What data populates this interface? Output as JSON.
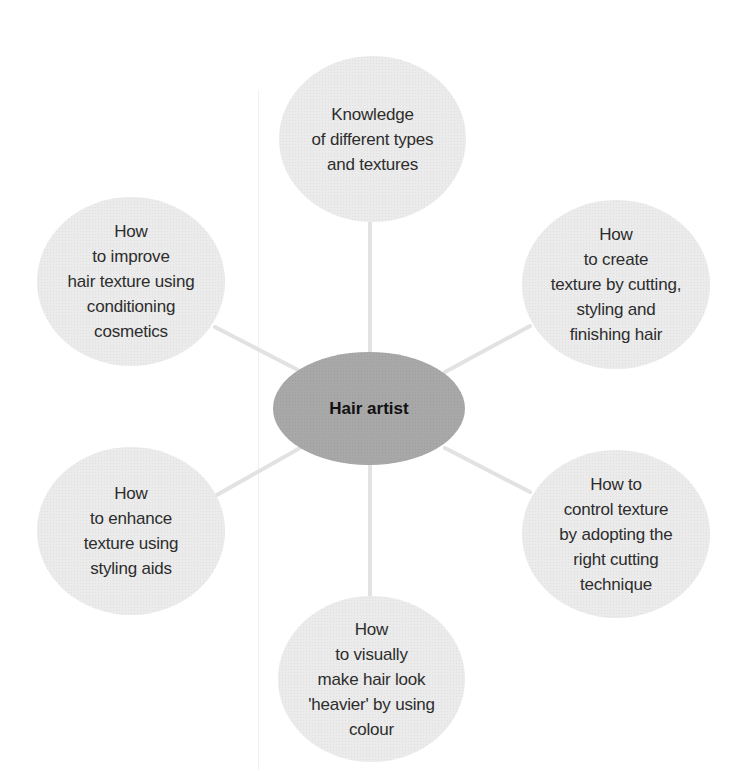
{
  "diagram": {
    "type": "mind-map",
    "center": {
      "label": "Hair artist",
      "fill": "#a8a8a8"
    },
    "branch_fill": "#ebebeb",
    "connector_color": "#e2e2e2",
    "branches": [
      {
        "position": "top",
        "label": "Knowledge\nof different types\nand textures"
      },
      {
        "position": "top-right",
        "label": "How\nto create\ntexture by cutting,\nstyling and\nfinishing hair"
      },
      {
        "position": "bottom-right",
        "label": "How to\ncontrol texture\nby adopting the\nright cutting\ntechnique"
      },
      {
        "position": "bottom",
        "label": "How\nto visually\nmake hair look\n'heavier' by using\ncolour"
      },
      {
        "position": "bottom-left",
        "label": "How\nto enhance\ntexture using\nstyling aids"
      },
      {
        "position": "top-left",
        "label": "How\nto improve\nhair texture using\nconditioning\ncosmetics"
      }
    ]
  }
}
